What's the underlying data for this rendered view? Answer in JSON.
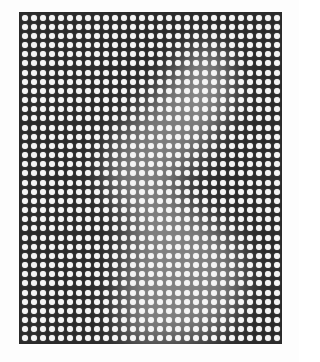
{
  "image": {
    "description": "Optical illusion: white dot grid on dark background with a faint hidden light figure",
    "grid": {
      "columns": 29,
      "rows": 36,
      "dot_color": "#f4f4f4",
      "background_color": "#2b2b2b",
      "ghost_color": "#8a8a8a"
    }
  }
}
